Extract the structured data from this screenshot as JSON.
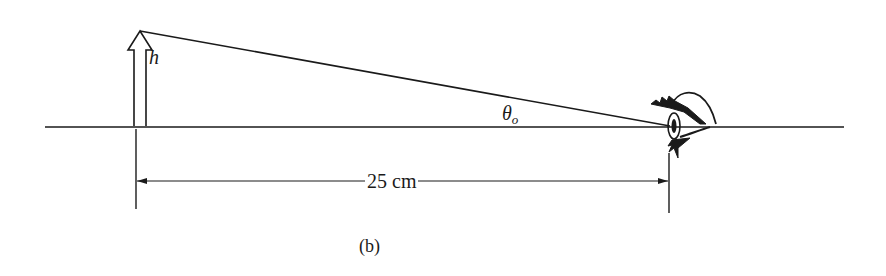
{
  "figure": {
    "caption": "(b)",
    "labels": {
      "object_height": "h",
      "angle_symbol": "θ",
      "angle_subscript": "o",
      "distance": "25 cm"
    },
    "elements": {
      "object": "upright hollow arrow",
      "observer": "eye (side profile)",
      "sight_line": "line from arrow tip to eye",
      "optical_axis": "horizontal line",
      "dimension": "double-headed arrow from object to eye"
    },
    "colors": {
      "stroke": "#1a1a1a",
      "background": "#ffffff"
    }
  }
}
